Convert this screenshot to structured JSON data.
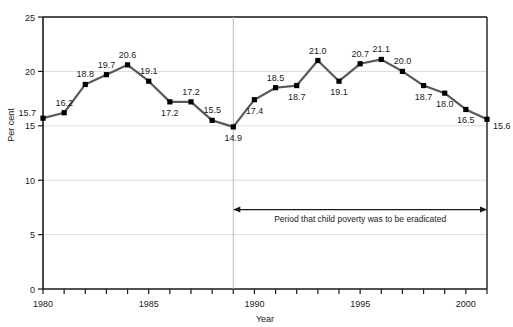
{
  "chart_data": {
    "type": "line",
    "title": "",
    "subtitle": "",
    "xlabel": "Year",
    "ylabel": "Per cent",
    "xlim": [
      1980,
      2001
    ],
    "ylim": [
      0,
      25
    ],
    "grid": true,
    "legend": "none",
    "x": [
      1980,
      1981,
      1982,
      1983,
      1984,
      1985,
      1986,
      1987,
      1988,
      1989,
      1990,
      1991,
      1992,
      1993,
      1994,
      1995,
      1996,
      1997,
      1998,
      1999,
      2000,
      2001
    ],
    "values": [
      15.7,
      16.2,
      18.8,
      19.7,
      20.6,
      19.1,
      17.2,
      17.2,
      15.5,
      14.9,
      17.4,
      18.5,
      18.7,
      21.0,
      19.1,
      20.7,
      21.1,
      20.0,
      18.7,
      18.0,
      16.5,
      15.6
    ],
    "point_labels": [
      "15.7",
      "16.2",
      "18.8",
      "19.7",
      "20.6",
      "19.1",
      "17.2",
      "17.2",
      "15.5",
      "14.9",
      "17.4",
      "18.5",
      "18.7",
      "21.0",
      "19.1",
      "20.7",
      "21.1",
      "20.0",
      "18.7",
      "18.0",
      "16.5",
      "15.6"
    ],
    "label_positions": [
      "left",
      "above",
      "above",
      "above",
      "above",
      "above",
      "below",
      "above",
      "above",
      "below",
      "below",
      "above",
      "below",
      "above",
      "below",
      "above",
      "above",
      "above",
      "below",
      "below",
      "below",
      "right"
    ],
    "ytick_labels": [
      "0",
      "5",
      "10",
      "15",
      "20",
      "25"
    ],
    "ytick_values": [
      0,
      5,
      10,
      15,
      20,
      25
    ],
    "xtick_labels": [
      "1980",
      "1985",
      "1990",
      "1995",
      "2000"
    ],
    "xtick_values": [
      1980,
      1985,
      1990,
      1995,
      2000
    ],
    "xtick_minor_values": [
      1981,
      1982,
      1983,
      1984,
      1986,
      1987,
      1988,
      1989,
      1991,
      1992,
      1993,
      1994,
      1996,
      1997,
      1998,
      1999,
      2001
    ],
    "reference_line": {
      "x": 1989,
      "label": ""
    },
    "annotation": {
      "text": "Period that child poverty was to be eradicated",
      "x_start": 1989,
      "x_end": 2001,
      "y": 7.3,
      "arrow": "double"
    },
    "series_color": "#595959",
    "marker_color": "#000000",
    "grid_color": "#dcdcdc",
    "axis_color": "#1a1a1a"
  }
}
